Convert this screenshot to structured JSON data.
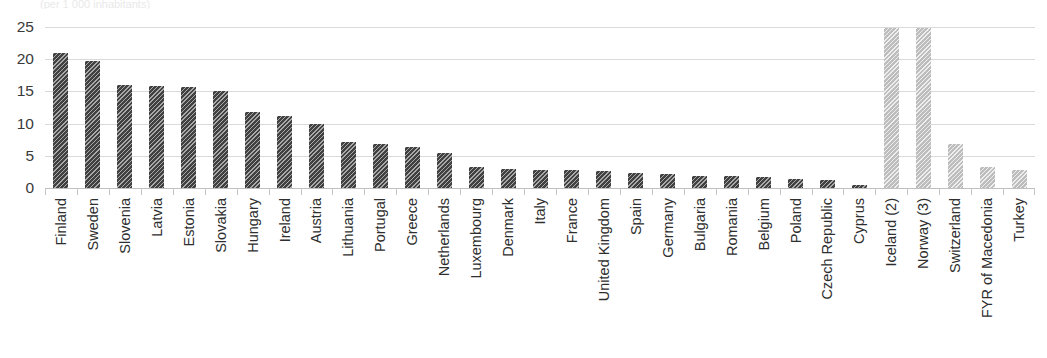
{
  "clipped_title": "(per 1 000 inhabitants)",
  "chart_data": {
    "type": "bar",
    "title": "",
    "subtitle": "",
    "xlabel": "",
    "ylabel": "",
    "ylim": [
      0,
      25
    ],
    "ytick_labels": [
      "25",
      "20",
      "15",
      "10",
      "5",
      "0"
    ],
    "ytick_values": [
      25,
      20,
      15,
      10,
      5,
      0
    ],
    "grid": true,
    "legend": "none",
    "clipped_top": true,
    "categories": [
      "Finland",
      "Sweden",
      "Slovenia",
      "Latvia",
      "Estonia",
      "Slovakia",
      "Hungary",
      "Ireland",
      "Austria",
      "Lithuania",
      "Portugal",
      "Greece",
      "Netherlands",
      "Luxembourg",
      "Denmark",
      "Italy",
      "France",
      "United Kingdom",
      "Spain",
      "Germany",
      "Bulgaria",
      "Romania",
      "Belgium",
      "Poland",
      "Czech Republic",
      "Cyprus",
      "Iceland (2)",
      "Norway (3)",
      "Switzerland",
      "FYR of Macedonia",
      "Turkey"
    ],
    "values": [
      21.0,
      19.8,
      16.0,
      15.9,
      15.7,
      15.0,
      11.8,
      11.2,
      10.0,
      7.2,
      6.9,
      6.4,
      5.4,
      3.3,
      2.9,
      2.8,
      2.8,
      2.7,
      2.4,
      2.2,
      1.9,
      1.8,
      1.7,
      1.4,
      1.3,
      0.4,
      24.9,
      24.9,
      6.8,
      3.3,
      2.8
    ],
    "series_groups": [
      {
        "name": "EU member states",
        "color": "#414141",
        "start_index": 0,
        "end_index": 25
      },
      {
        "name": "Non-EU countries",
        "color": "#bdbdbd",
        "start_index": 26,
        "end_index": 30
      }
    ],
    "colors": {
      "bar_dark": "#414141",
      "bar_light": "#bdbdbd",
      "gridline": "#d9d9d9",
      "axis": "#bfbfbf",
      "text": "#2e2e2e"
    }
  }
}
